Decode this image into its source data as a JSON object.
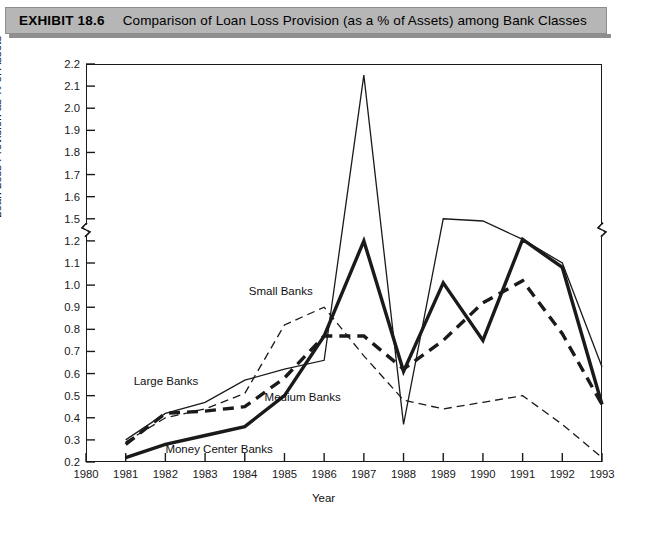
{
  "exhibit": {
    "number": "EXHIBIT 18.6",
    "title": "Comparison of Loan Loss Provision (as a % of Assets) among Bank Classes"
  },
  "chart_data": {
    "type": "line",
    "title": "Comparison of Loan Loss Provision (as a % of Assets) among Bank Classes",
    "xlabel": "Year",
    "ylabel": "Loan Loss Provision as % of Assets",
    "grid": false,
    "legend_position": "inline-annotations",
    "x": [
      1981,
      1982,
      1983,
      1984,
      1985,
      1986,
      1987,
      1988,
      1989,
      1990,
      1991,
      1992,
      1993
    ],
    "xlim": [
      1980,
      1993
    ],
    "xticks": [
      1980,
      1981,
      1982,
      1983,
      1984,
      1985,
      1986,
      1987,
      1988,
      1989,
      1990,
      1991,
      1992,
      1993
    ],
    "yticks": [
      0.2,
      0.3,
      0.4,
      0.5,
      0.6,
      0.7,
      0.8,
      0.9,
      1.0,
      1.1,
      1.2,
      1.5,
      1.6,
      1.7,
      1.8,
      1.9,
      2.0,
      2.1,
      2.2
    ],
    "ylim": [
      0.2,
      2.2
    ],
    "axis_break": {
      "between": [
        1.2,
        1.5
      ],
      "marker": "zigzag"
    },
    "series": [
      {
        "name": "Large Banks",
        "style": "thin-solid",
        "values": [
          0.3,
          0.42,
          0.47,
          0.57,
          0.62,
          0.66,
          2.15,
          0.37,
          1.5,
          1.47,
          1.22,
          1.1,
          0.63
        ]
      },
      {
        "name": "Small Banks",
        "style": "thin-dashed",
        "values": [
          0.29,
          0.4,
          0.44,
          0.51,
          0.82,
          0.9,
          0.68,
          0.48,
          0.44,
          0.47,
          0.5,
          0.37,
          0.22
        ]
      },
      {
        "name": "Medium Banks",
        "style": "thick-dashed",
        "values": [
          0.28,
          0.42,
          0.43,
          0.45,
          0.58,
          0.77,
          0.77,
          0.62,
          0.75,
          0.92,
          1.02,
          0.78,
          0.46
        ]
      },
      {
        "name": "Money Center Banks",
        "style": "thick-solid",
        "values": [
          0.22,
          0.28,
          0.32,
          0.36,
          0.5,
          0.77,
          1.2,
          0.61,
          1.01,
          0.75,
          1.22,
          1.08,
          0.46
        ]
      }
    ],
    "annotations": [
      {
        "text": "Small Banks",
        "x": 1984.1,
        "y": 0.97
      },
      {
        "text": "Large Banks",
        "x": 1981.2,
        "y": 0.56
      },
      {
        "text": "Medium Banks",
        "x": 1984.5,
        "y": 0.49
      },
      {
        "text": "Money Center Banks",
        "x": 1982.0,
        "y": 0.255
      }
    ]
  },
  "colors": {
    "header_bar": "#b6b6b6",
    "header_shadow": "#8f8f8f",
    "axis": "#1a1a1a",
    "series_line": "#1a1a1a",
    "plot_background": "#ffffff"
  }
}
